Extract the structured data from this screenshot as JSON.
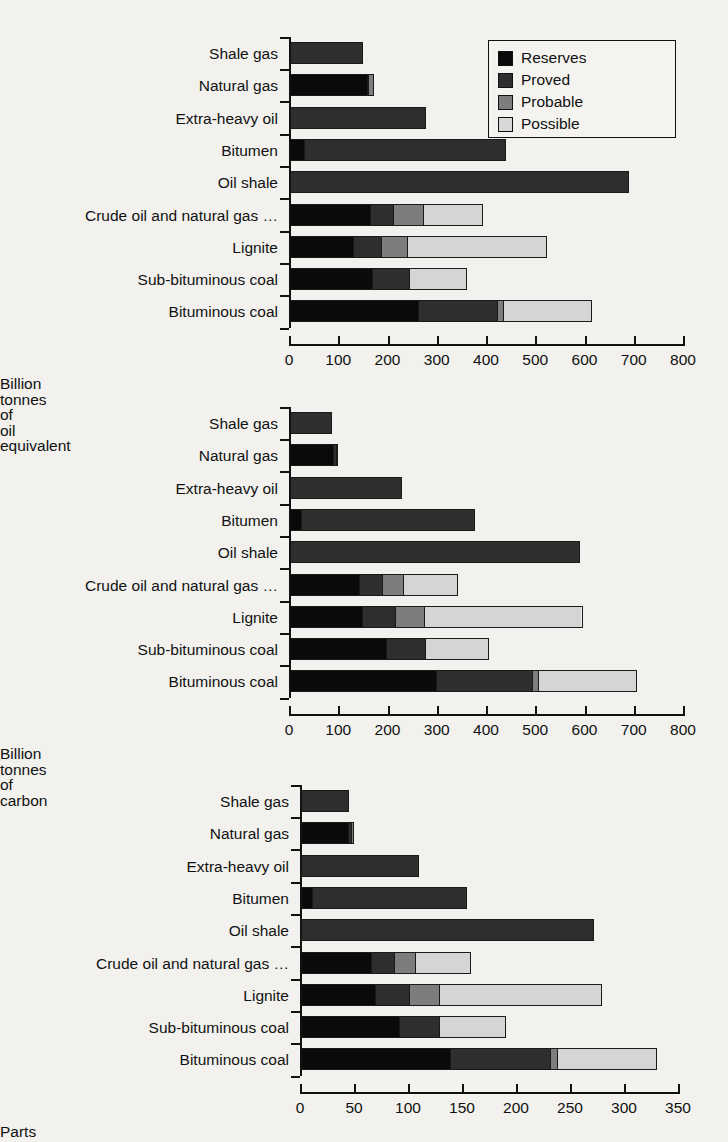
{
  "legend": {
    "position": "top-right",
    "entries": [
      {
        "key": "reserves",
        "label": "Reserves",
        "color": "#0a0a0a"
      },
      {
        "key": "proved",
        "label": "Proved",
        "color": "#2e2e2e"
      },
      {
        "key": "probable",
        "label": "Probable",
        "color": "#7d7d7d"
      },
      {
        "key": "possible",
        "label": "Possible",
        "color": "#d8d8d8"
      }
    ]
  },
  "chart_data": [
    {
      "type": "bar",
      "orientation": "horizontal",
      "stacked": true,
      "title": "",
      "xlabel": "Billion tonnes of oil equivalent",
      "ylabel": "",
      "xlim": [
        0,
        800
      ],
      "xticks": [
        0,
        100,
        200,
        300,
        400,
        500,
        600,
        700,
        800
      ],
      "xticklabels": [
        "0",
        "100",
        "200",
        "300",
        "400",
        "500",
        "600",
        "700",
        "800"
      ],
      "grid": false,
      "categories": [
        "Shale gas",
        "Natural gas",
        "Extra-heavy oil",
        "Bitumen",
        "Oil shale",
        "Crude oil and natural gas …",
        "Lignite",
        "Sub-bituminous coal",
        "Bituminous coal"
      ],
      "series": [
        {
          "name": "Reserves",
          "values": [
            0,
            160,
            0,
            28,
            0,
            165,
            128,
            168,
            262
          ]
        },
        {
          "name": "Proved",
          "values": [
            150,
            2,
            278,
            412,
            690,
            46,
            59,
            76,
            162
          ]
        },
        {
          "name": "Probable",
          "values": [
            0,
            10,
            0,
            0,
            0,
            61,
            52,
            0,
            11
          ]
        },
        {
          "name": "Possible",
          "values": [
            0,
            0,
            0,
            0,
            0,
            122,
            285,
            118,
            180
          ]
        }
      ],
      "totals": [
        150,
        172,
        278,
        440,
        690,
        394,
        524,
        362,
        615
      ]
    },
    {
      "type": "bar",
      "orientation": "horizontal",
      "stacked": true,
      "title": "",
      "xlabel": "Billion tonnes of carbon",
      "ylabel": "",
      "xlim": [
        0,
        800
      ],
      "xticks": [
        0,
        100,
        200,
        300,
        400,
        500,
        600,
        700,
        800
      ],
      "xticklabels": [
        "0",
        "100",
        "200",
        "300",
        "400",
        "500",
        "600",
        "700",
        "800"
      ],
      "grid": false,
      "categories": [
        "Shale gas",
        "Natural gas",
        "Extra-heavy oil",
        "Bitumen",
        "Oil shale",
        "Crude oil and natural gas …",
        "Lignite",
        "Sub-bituminous coal",
        "Bituminous coal"
      ],
      "series": [
        {
          "name": "Reserves",
          "values": [
            0,
            92,
            0,
            22,
            0,
            142,
            147,
            197,
            298
          ]
        },
        {
          "name": "Proved",
          "values": [
            87,
            5,
            230,
            355,
            590,
            47,
            68,
            79,
            196
          ]
        },
        {
          "name": "Probable",
          "values": [
            0,
            3,
            0,
            0,
            0,
            44,
            59,
            0,
            13
          ]
        },
        {
          "name": "Possible",
          "values": [
            0,
            0,
            0,
            0,
            0,
            110,
            322,
            131,
            200
          ]
        }
      ],
      "totals": [
        87,
        100,
        230,
        377,
        590,
        343,
        596,
        407,
        707
      ]
    },
    {
      "type": "bar",
      "orientation": "horizontal",
      "stacked": true,
      "title": "",
      "xlabel": "Parts per million by volume",
      "ylabel": "",
      "xlim": [
        0,
        350
      ],
      "xticks": [
        0,
        50,
        100,
        150,
        200,
        250,
        300,
        350
      ],
      "xticklabels": [
        "0",
        "50",
        "100",
        "150",
        "200",
        "250",
        "300",
        "350"
      ],
      "grid": false,
      "categories": [
        "Shale gas",
        "Natural gas",
        "Extra-heavy oil",
        "Bitumen",
        "Oil shale",
        "Crude oil and natural gas …",
        "Lignite",
        "Sub-bituminous coal",
        "Bituminous coal"
      ],
      "series": [
        {
          "name": "Reserves",
          "values": [
            0,
            45,
            0,
            10,
            0,
            66,
            69,
            92,
            139
          ]
        },
        {
          "name": "Proved",
          "values": [
            45,
            3,
            110,
            145,
            272,
            21,
            32,
            37,
            93
          ]
        },
        {
          "name": "Probable",
          "values": [
            0,
            2,
            0,
            0,
            0,
            20,
            28,
            0,
            6
          ]
        },
        {
          "name": "Possible",
          "values": [
            0,
            0,
            0,
            0,
            0,
            51,
            151,
            62,
            93
          ]
        }
      ],
      "totals": [
        45,
        50,
        110,
        155,
        272,
        158,
        280,
        191,
        331
      ]
    }
  ]
}
